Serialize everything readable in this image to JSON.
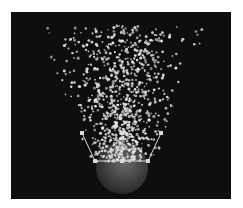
{
  "viewport": {
    "background": "#0e0e0e",
    "frame": {
      "x": 11,
      "y": 12,
      "width": 220,
      "height": 187
    }
  },
  "emitter": {
    "shape": "sphere",
    "center": [
      111,
      156
    ],
    "radius": 26,
    "fill_center": "#6a6a6a",
    "fill_edge": "#232323"
  },
  "gizmo": {
    "color": "#d8d8d8",
    "base_line": [
      [
        84,
        149
      ],
      [
        137,
        149
      ]
    ],
    "left_side": [
      [
        84,
        149
      ],
      [
        71,
        121
      ]
    ],
    "right_side": [
      [
        137,
        149
      ],
      [
        150,
        121
      ]
    ],
    "center_axis": [
      [
        111,
        149
      ],
      [
        111,
        121
      ]
    ],
    "handles": [
      [
        84,
        149
      ],
      [
        111,
        149
      ],
      [
        137,
        149
      ],
      [
        71,
        121
      ],
      [
        150,
        121
      ],
      [
        111,
        121
      ]
    ]
  },
  "particles": {
    "count": 900,
    "seed": 7,
    "color": "#e4e4e4",
    "top_y": 14,
    "bottom_y": 150,
    "top_half_width": 80,
    "bottom_half_width": 30,
    "center_x": 111,
    "radius_range": [
      0.8,
      1.6
    ]
  }
}
